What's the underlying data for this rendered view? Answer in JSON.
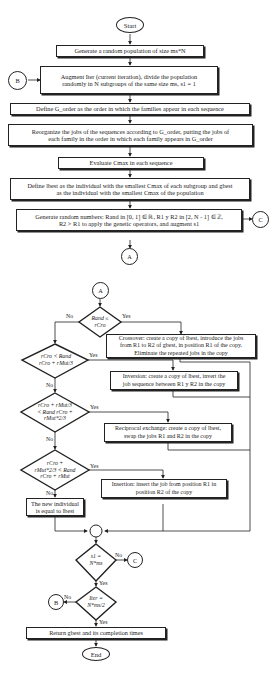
{
  "flowchart": {
    "start": "Start",
    "end": "End",
    "steps": {
      "generate_population": "Generate a random population of size ms*N",
      "augment_iter_line1": "Augment Iter (current iteration), divide the population",
      "augment_iter_line2": "randomly in N subgroups of the same size ms, s1 = 1",
      "define_gorder": "Define G_order as the order in which the families appear in each sequence",
      "reorganize_line1": "Reorganize the jobs of the sequences according to G_order, putting the jobs of",
      "reorganize_line2": "each family in the order in which each family appears in G_order",
      "evaluate_cmax": "Evaluate Cmax in each sequence",
      "define_best_line1": "Define lbest as the individual with the smallest Cmax of each subgroup and gbest",
      "define_best_line2": "as the individual with the smallest Cmax of the population",
      "random_numbers_line1": "Generate random numbers: Rand in [0, 1] ∈ ℝ, R1 y R2 in [2, N - 1] ∈ ℤ,",
      "random_numbers_line2": "R2 > R1 to apply the genetic operators, and augment s1",
      "crossover_line1": "Crossover: create a copy of lbest, introduce the jobs",
      "crossover_line2": "from R1 to R2 of gbest, in position R1 of the copy.",
      "crossover_line3": "Eliminate the repeated jobs in the copy",
      "inversion_line1": "Inversion: create a copy of lbest, invert the",
      "inversion_line2": "job sequence between R1 y R2 in the copy",
      "reciprocal_line1": "Reciprocal exchange: create a copy of lbest,",
      "reciprocal_line2": "swap the jobs R1 and R2 in the copy",
      "insertion_line1": "Insertion: insert the job from position R1 in",
      "insertion_line2": "position R2 of the copy",
      "new_individual_line1": "The new individual",
      "new_individual_line2": "is equal to lbest",
      "return_gbest": "Return gbest and its completion times"
    },
    "decisions": {
      "d1": [
        "Rand ≤",
        "rCro"
      ],
      "d2": [
        "rCro < Rand",
        "rCro + rMut/3"
      ],
      "d3": [
        "rCro + rMut/3",
        "< Rand    rCro +",
        "rMut*2/3"
      ],
      "d4": [
        "rCro +",
        "rMut*2/3 < Rand",
        "rCro + rMut"
      ],
      "d5": [
        "s1 =",
        "N*ms"
      ],
      "d6": [
        "Iter =",
        "N*ms/2"
      ]
    },
    "connectors": {
      "a": "A",
      "b": "B",
      "c": "C"
    },
    "labels": {
      "yes": "Yes",
      "no": "No"
    }
  }
}
